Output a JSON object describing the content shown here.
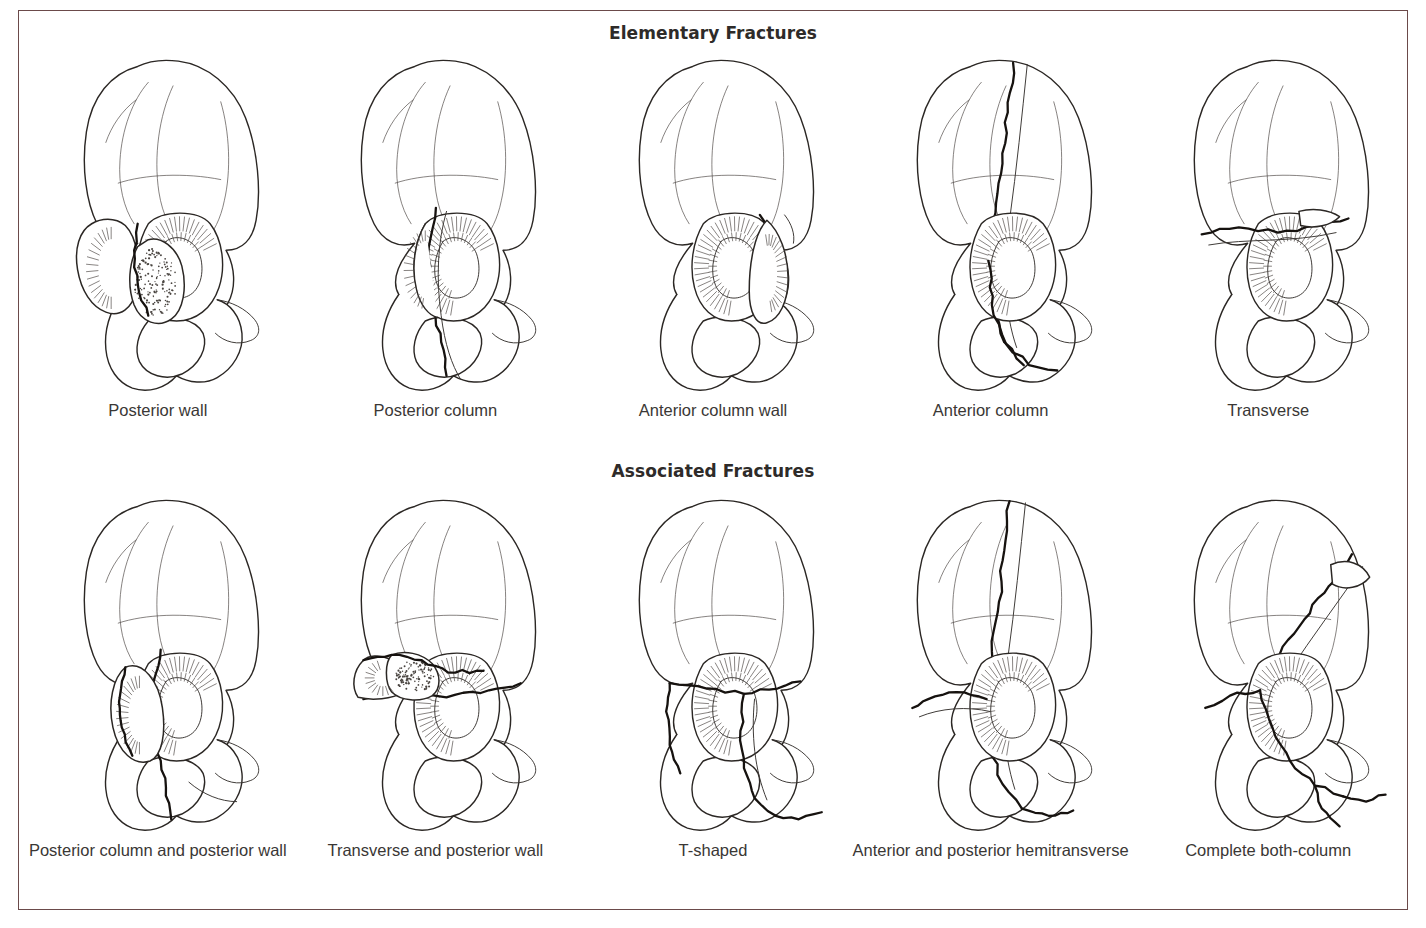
{
  "figure": {
    "frame_color": "#6b4a4a",
    "background": "#ffffff",
    "ink_color": "#2b2724",
    "label_color": "#3a3735",
    "heading_color": "#2e2b29"
  },
  "sections": [
    {
      "id": "elementary",
      "heading": "Elementary Fractures",
      "panels": [
        {
          "label": "Posterior wall",
          "pattern": "posterior-wall"
        },
        {
          "label": "Posterior column",
          "pattern": "posterior-column"
        },
        {
          "label": "Anterior column wall",
          "pattern": "anterior-column-wall"
        },
        {
          "label": "Anterior column",
          "pattern": "anterior-column"
        },
        {
          "label": "Transverse",
          "pattern": "transverse"
        }
      ]
    },
    {
      "id": "associated",
      "heading": "Associated Fractures",
      "panels": [
        {
          "label": "Posterior column and posterior wall",
          "pattern": "post-column-post-wall"
        },
        {
          "label": "Transverse and posterior wall",
          "pattern": "transverse-post-wall"
        },
        {
          "label": "T-shaped",
          "pattern": "t-shaped"
        },
        {
          "label": "Anterior and posterior hemitransverse",
          "pattern": "ant-post-hemitransverse"
        },
        {
          "label": "Complete both-column",
          "pattern": "complete-both-column"
        }
      ]
    }
  ]
}
